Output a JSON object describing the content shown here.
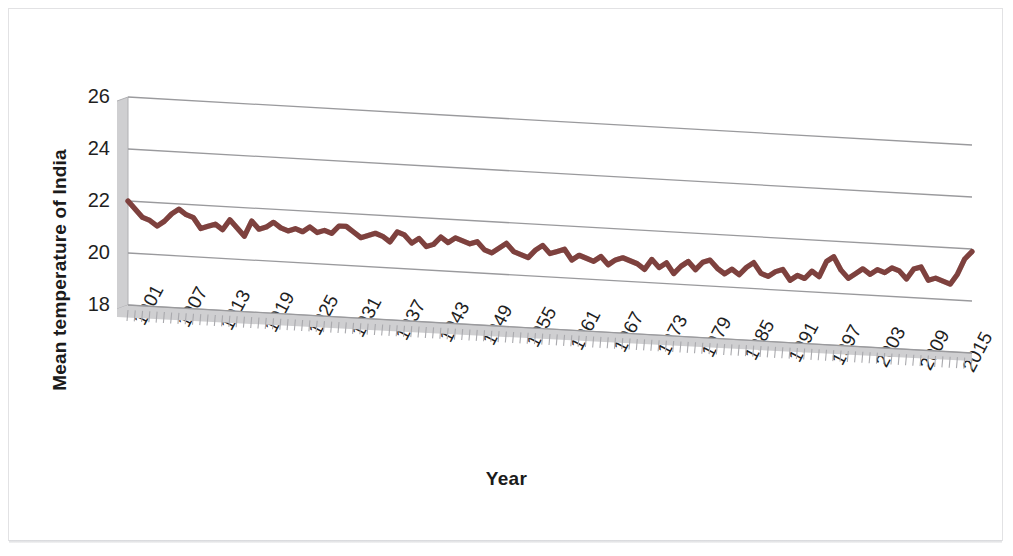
{
  "figure": {
    "kind": "3d-line-chart",
    "background": "#ffffff",
    "frame_color": "#e2e2e4"
  },
  "chart_data": {
    "type": "line",
    "title": "",
    "subtitle": "",
    "xlabel": "Year",
    "ylabel": "Mean temperature of India",
    "grid": true,
    "legend": false,
    "legend_position": "none",
    "line_color": "#7E413E",
    "gridline_color": "#9a9a9d",
    "axis_wall_color": "#cfcfd1",
    "ylim": [
      18,
      26
    ],
    "ytick_labels": [
      "18",
      "20",
      "22",
      "24",
      "26"
    ],
    "yticks": [
      18,
      20,
      22,
      24,
      26
    ],
    "xlim": [
      1901,
      2017
    ],
    "xtick_labels": [
      "1901",
      "1907",
      "1913",
      "1919",
      "1925",
      "1931",
      "1937",
      "1943",
      "1949",
      "1955",
      "1961",
      "1967",
      "1973",
      "1979",
      "1985",
      "1991",
      "1997",
      "2003",
      "2009",
      "2015"
    ],
    "xticks": [
      1901,
      1907,
      1913,
      1919,
      1925,
      1931,
      1937,
      1943,
      1949,
      1955,
      1961,
      1967,
      1973,
      1979,
      1985,
      1991,
      1997,
      2003,
      2009,
      2015
    ],
    "xtick_step": 6,
    "xtick_minor_step": 1,
    "series": [
      {
        "name": "Mean temperature of India",
        "color": "#7E413E",
        "x": [
          1901,
          1902,
          1903,
          1904,
          1905,
          1906,
          1907,
          1908,
          1909,
          1910,
          1911,
          1912,
          1913,
          1914,
          1915,
          1916,
          1917,
          1918,
          1919,
          1920,
          1921,
          1922,
          1923,
          1924,
          1925,
          1926,
          1927,
          1928,
          1929,
          1930,
          1931,
          1932,
          1933,
          1934,
          1935,
          1936,
          1937,
          1938,
          1939,
          1940,
          1941,
          1942,
          1943,
          1944,
          1945,
          1946,
          1947,
          1948,
          1949,
          1950,
          1951,
          1952,
          1953,
          1954,
          1955,
          1956,
          1957,
          1958,
          1959,
          1960,
          1961,
          1962,
          1963,
          1964,
          1965,
          1966,
          1967,
          1968,
          1969,
          1970,
          1971,
          1972,
          1973,
          1974,
          1975,
          1976,
          1977,
          1978,
          1979,
          1980,
          1981,
          1982,
          1983,
          1984,
          1985,
          1986,
          1987,
          1988,
          1989,
          1990,
          1991,
          1992,
          1993,
          1994,
          1995,
          1996,
          1997,
          1998,
          1999,
          2000,
          2001,
          2002,
          2003,
          2004,
          2005,
          2006,
          2007,
          2008,
          2009,
          2010,
          2011,
          2012,
          2013,
          2014,
          2015,
          2016,
          2017
        ],
        "values": [
          22.0,
          21.7,
          21.4,
          21.3,
          21.1,
          21.3,
          21.6,
          21.8,
          21.6,
          21.5,
          21.1,
          21.2,
          21.3,
          21.1,
          21.5,
          21.2,
          20.9,
          21.5,
          21.2,
          21.3,
          21.5,
          21.3,
          21.2,
          21.3,
          21.2,
          21.4,
          21.2,
          21.3,
          21.2,
          21.5,
          21.5,
          21.3,
          21.1,
          21.2,
          21.3,
          21.2,
          21.0,
          21.4,
          21.3,
          21.0,
          21.2,
          20.9,
          21.0,
          21.3,
          21.1,
          21.3,
          21.2,
          21.1,
          21.2,
          20.9,
          20.8,
          21.0,
          21.2,
          20.9,
          20.8,
          20.7,
          21.0,
          21.2,
          20.9,
          21.0,
          21.1,
          20.7,
          20.9,
          20.8,
          20.7,
          20.9,
          20.6,
          20.8,
          20.9,
          20.8,
          20.7,
          20.5,
          20.9,
          20.6,
          20.8,
          20.4,
          20.7,
          20.9,
          20.6,
          20.9,
          21.0,
          20.7,
          20.5,
          20.7,
          20.5,
          20.8,
          21.0,
          20.6,
          20.5,
          20.7,
          20.8,
          20.4,
          20.6,
          20.5,
          20.8,
          20.6,
          21.2,
          21.4,
          20.9,
          20.6,
          20.8,
          21.0,
          20.8,
          21.0,
          20.9,
          21.1,
          21.0,
          20.7,
          21.1,
          21.2,
          20.7,
          20.8,
          20.7,
          20.6,
          21.0,
          21.6,
          21.9
        ]
      }
    ]
  },
  "labels": {
    "y_axis_title": "Mean temperature of India",
    "x_axis_title": "Year"
  }
}
